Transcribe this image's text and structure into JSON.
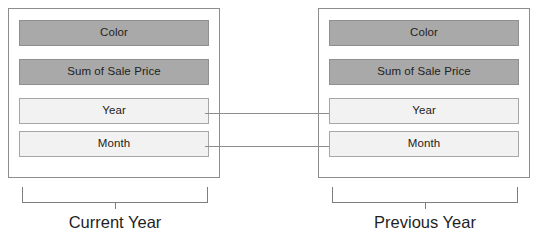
{
  "diagram": {
    "heading_clipped": "",
    "groups": [
      {
        "id": "current-year",
        "caption": "Current Year",
        "fields": [
          {
            "label": "Color",
            "style": "shaded"
          },
          {
            "label": "Sum of Sale Price",
            "style": "shaded"
          },
          {
            "label": "Year",
            "style": "plain"
          },
          {
            "label": "Month",
            "style": "plain"
          }
        ]
      },
      {
        "id": "previous-year",
        "caption": "Previous Year",
        "fields": [
          {
            "label": "Color",
            "style": "shaded"
          },
          {
            "label": "Sum of Sale Price",
            "style": "shaded"
          },
          {
            "label": "Year",
            "style": "plain"
          },
          {
            "label": "Month",
            "style": "plain"
          }
        ]
      }
    ],
    "connectors": [
      {
        "id": "year-link",
        "from": "current-year.Year",
        "to": "previous-year.Year"
      },
      {
        "id": "month-link",
        "from": "current-year.Month",
        "to": "previous-year.Month"
      }
    ],
    "colors": {
      "shaded_fill": "#a9a9a9",
      "plain_fill": "#f2f2f2",
      "border": "#8d8d8d",
      "line": "#7d7d7d",
      "text": "#222222",
      "background": "#ffffff"
    }
  }
}
